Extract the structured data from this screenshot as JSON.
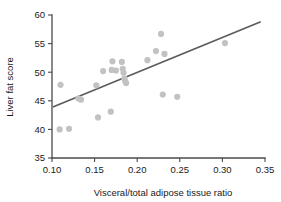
{
  "chart_data": {
    "type": "scatter",
    "title": "",
    "subtitle": "",
    "xlabel": "Visceral/total adipose tissue ratio",
    "ylabel": "Liver fat score",
    "xlim": [
      0.1,
      0.35
    ],
    "ylim": [
      35,
      60
    ],
    "xticks": [
      0.1,
      0.15,
      0.2,
      0.25,
      0.3,
      0.35
    ],
    "xtick_labels": [
      "0.10",
      "0.15",
      "0.20",
      "0.25",
      "0.30",
      "0.35"
    ],
    "yticks": [
      35,
      40,
      45,
      50,
      55,
      60
    ],
    "ytick_labels": [
      "35",
      "40",
      "45",
      "50",
      "55",
      "60"
    ],
    "grid": false,
    "legend": false,
    "legend_position": "none",
    "point_color": "#c2c2c2",
    "line_color": "#5a5a5a",
    "axis_color": "#4a4a4a",
    "point_radius": 3.1,
    "series": [
      {
        "name": "Subjects",
        "marker": "circle",
        "points": [
          {
            "x": 0.109,
            "y": 40.0
          },
          {
            "x": 0.11,
            "y": 47.8
          },
          {
            "x": 0.12,
            "y": 40.1
          },
          {
            "x": 0.131,
            "y": 45.4
          },
          {
            "x": 0.134,
            "y": 45.2
          },
          {
            "x": 0.152,
            "y": 47.7
          },
          {
            "x": 0.154,
            "y": 42.1
          },
          {
            "x": 0.16,
            "y": 50.2
          },
          {
            "x": 0.169,
            "y": 43.1
          },
          {
            "x": 0.17,
            "y": 50.4
          },
          {
            "x": 0.171,
            "y": 51.9
          },
          {
            "x": 0.175,
            "y": 50.3
          },
          {
            "x": 0.182,
            "y": 51.8
          },
          {
            "x": 0.183,
            "y": 50.6
          },
          {
            "x": 0.184,
            "y": 49.9
          },
          {
            "x": 0.185,
            "y": 48.9
          },
          {
            "x": 0.186,
            "y": 48.4
          },
          {
            "x": 0.187,
            "y": 48.1
          },
          {
            "x": 0.212,
            "y": 52.1
          },
          {
            "x": 0.222,
            "y": 53.7
          },
          {
            "x": 0.228,
            "y": 56.7
          },
          {
            "x": 0.23,
            "y": 46.1
          },
          {
            "x": 0.232,
            "y": 53.2
          },
          {
            "x": 0.247,
            "y": 45.7
          },
          {
            "x": 0.303,
            "y": 55.1
          }
        ]
      }
    ],
    "fit_line": {
      "name": "Linear regression line",
      "x_start": 0.101,
      "y_start": 43.9,
      "x_end": 0.345,
      "y_end": 58.8
    }
  }
}
